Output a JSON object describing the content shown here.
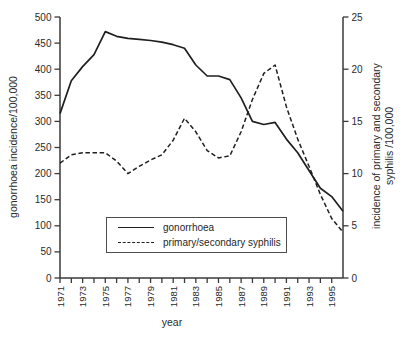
{
  "figure": {
    "xlabel": "year",
    "ylabel_left": "gonorrhoea incidence/100,000",
    "ylabel_right_line1": "incidence of primary and secondary",
    "ylabel_right_line2": "syphilis /100,000"
  },
  "legend": {
    "items": [
      {
        "label": "gonorrhoea",
        "style": "solid"
      },
      {
        "label": "primary/secondary syphilis",
        "style": "dashed"
      }
    ]
  },
  "colors": {
    "background": "#ffffff",
    "line": "#1f1f1f",
    "axis": "#3a3a3a",
    "text": "#2b2b2b",
    "legend_border": "#4d4d4d"
  },
  "chart_data": {
    "type": "line",
    "title": "",
    "xlabel": "year",
    "grid": false,
    "legend_position": "inside-bottom-left",
    "x": [
      1971,
      1972,
      1973,
      1974,
      1975,
      1976,
      1977,
      1978,
      1979,
      1980,
      1981,
      1982,
      1983,
      1984,
      1985,
      1986,
      1987,
      1988,
      1989,
      1990,
      1991,
      1992,
      1993,
      1994,
      1995,
      1996
    ],
    "x_tick_years": [
      1971,
      1972,
      1973,
      1974,
      1975,
      1976,
      1977,
      1978,
      1979,
      1980,
      1981,
      1982,
      1983,
      1984,
      1985,
      1986,
      1987,
      1988,
      1989,
      1990,
      1991,
      1992,
      1993,
      1994,
      1995
    ],
    "x_tick_labels_shown": [
      "1971",
      "1973",
      "1975",
      "1977",
      "1979",
      "1981",
      "1983",
      "1985",
      "1987",
      "1989",
      "1991",
      "1993",
      "1995"
    ],
    "left_axis": {
      "label": "gonorrhoea incidence/100,000",
      "min": 0,
      "max": 500,
      "tick_step": 50
    },
    "right_axis": {
      "label": "incidence of primary and secondary syphilis /100,000",
      "min": 0,
      "max": 25,
      "tick_step": 5
    },
    "series": [
      {
        "name": "gonorrhoea",
        "axis": "left",
        "line_style": "solid",
        "values": [
          315,
          378,
          405,
          428,
          472,
          463,
          459,
          457,
          455,
          452,
          447,
          440,
          408,
          387,
          387,
          380,
          345,
          300,
          294,
          298,
          266,
          240,
          206,
          172,
          156,
          128
        ]
      },
      {
        "name": "primary/secondary syphilis",
        "axis": "right",
        "line_style": "dashed",
        "values": [
          11.0,
          11.8,
          12.0,
          12.0,
          12.0,
          11.2,
          10.0,
          10.7,
          11.3,
          11.8,
          13.2,
          15.3,
          14.0,
          12.2,
          11.5,
          11.7,
          14.0,
          17.1,
          19.6,
          20.4,
          16.4,
          13.3,
          10.7,
          8.0,
          5.7,
          4.4
        ]
      }
    ]
  }
}
